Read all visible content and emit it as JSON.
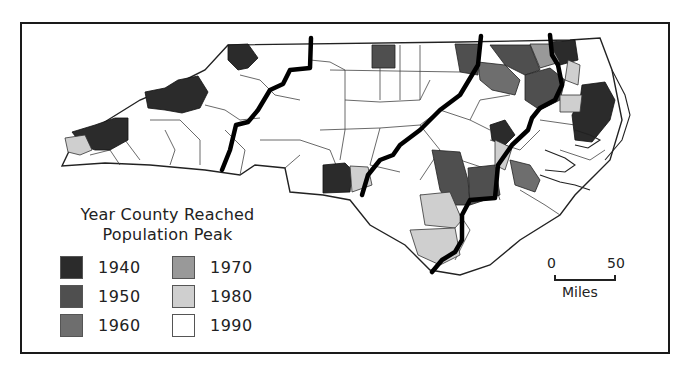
{
  "map": {
    "subject": "North Carolina counties",
    "legend": {
      "title_line1": "Year County Reached",
      "title_line2": "Population Peak",
      "items": [
        {
          "label": "1940",
          "color": "#2b2b2b"
        },
        {
          "label": "1950",
          "color": "#4f4f4f"
        },
        {
          "label": "1960",
          "color": "#6e6e6e"
        },
        {
          "label": "1970",
          "color": "#999999"
        },
        {
          "label": "1980",
          "color": "#cfcfcf"
        },
        {
          "label": "1990",
          "color": "#ffffff"
        }
      ]
    },
    "scale_bar": {
      "start": "0",
      "end": "50",
      "unit": "Miles"
    },
    "colors": {
      "frame": "#1a1a1a",
      "county_border": "#333333",
      "region_divider": "#000000",
      "background": "#ffffff"
    }
  }
}
